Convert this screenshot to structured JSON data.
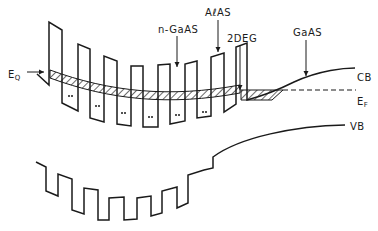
{
  "diagram": {
    "type": "energy-band-diagram",
    "labels": {
      "eq": "E",
      "eq_sub": "Q",
      "ngaas": "n-GaAs",
      "alas": "AℓAS",
      "twodeg": "2DEG",
      "gaas": "GaAS",
      "cb": "CB",
      "ef": "E",
      "ef_sub": "F",
      "vb": "VB"
    },
    "ngaas_display": "n-GaAS",
    "colors": {
      "stroke": "#1a1a1a",
      "background": "#ffffff"
    }
  }
}
